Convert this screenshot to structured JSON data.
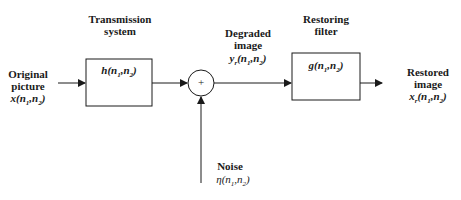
{
  "diagram": {
    "type": "block-diagram",
    "nodes": {
      "input": {
        "label_line1": "Original",
        "label_line2": "picture",
        "symbol": "x",
        "args": "(n",
        "sub1": "1",
        "comma": ",n",
        "sub2": "2",
        "close": ")"
      },
      "transmission": {
        "caption_line1": "Transmission",
        "caption_line2": "system",
        "symbol": "h",
        "args": "(n",
        "sub1": "1",
        "comma": ",n",
        "sub2": "2",
        "close": ")"
      },
      "sum": {
        "symbol": "+"
      },
      "degraded": {
        "label_line1": "Degraded",
        "label_line2": "image",
        "symbol": "y",
        "symbol_sub": "r",
        "args": "(n",
        "sub1": "1",
        "comma": ",n",
        "sub2": "2",
        "close": ")"
      },
      "filter": {
        "caption_line1": "Restoring",
        "caption_line2": "filter",
        "symbol": "g",
        "args": "(n",
        "sub1": "1",
        "comma": ",n",
        "sub2": "2",
        "close": ")"
      },
      "output": {
        "label_line1": "Restored",
        "label_line2": "image",
        "symbol": "x",
        "symbol_sub": "r",
        "args": "(n",
        "sub1": "1",
        "comma": ",n",
        "sub2": "2",
        "close": ")"
      },
      "noise": {
        "label_line1": "Noise",
        "symbol": "η",
        "args": "(n",
        "sub1": "1",
        "comma": ",n",
        "sub2": "2",
        "close": ")"
      }
    },
    "edges": [
      {
        "from": "input",
        "to": "transmission"
      },
      {
        "from": "transmission",
        "to": "sum"
      },
      {
        "from": "noise",
        "to": "sum"
      },
      {
        "from": "sum",
        "to": "filter"
      },
      {
        "from": "filter",
        "to": "output"
      }
    ],
    "colors": {
      "line": "#1a1a1a",
      "background": "#ffffff"
    }
  }
}
